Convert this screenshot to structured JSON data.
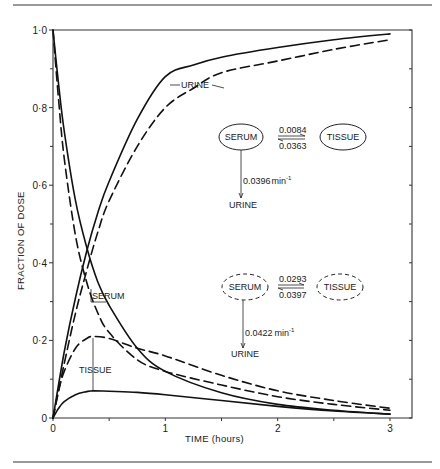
{
  "figure": {
    "top_rule": true,
    "bottom_rule": true
  },
  "chart_data": {
    "type": "line",
    "title": "",
    "xlabel": "TIME (hours)",
    "ylabel": "FRACTION OF DOSE",
    "xlim": [
      0,
      3
    ],
    "ylim": [
      0,
      1.0
    ],
    "x_ticks": [
      0,
      1,
      2,
      3
    ],
    "x_tick_labels": [
      "0",
      "1",
      "2",
      "3"
    ],
    "x_minor_ticks": [
      0.5,
      1.5,
      2.5
    ],
    "y_ticks": [
      0,
      0.2,
      0.4,
      0.6,
      0.8,
      1.0
    ],
    "y_tick_labels": [
      "0",
      "0·2",
      "0·4",
      "0·6",
      "0·8",
      "1·0"
    ],
    "y_minor_ticks": [
      0.1,
      0.3,
      0.5,
      0.7,
      0.9
    ],
    "right_axis_ticks": true,
    "grid": false,
    "legend": "none (inline labels and compartment diagrams)",
    "series": [
      {
        "name": "Urine (model 1, solid)",
        "style": "solid",
        "x": [
          0,
          0.1,
          0.2,
          0.3,
          0.4,
          0.5,
          0.75,
          1.0,
          1.25,
          1.5,
          2.0,
          2.5,
          3.0
        ],
        "y": [
          0,
          0.17,
          0.31,
          0.43,
          0.53,
          0.61,
          0.77,
          0.88,
          0.91,
          0.93,
          0.955,
          0.975,
          0.99
        ]
      },
      {
        "name": "Urine (model 2, dashed)",
        "style": "dashed",
        "x": [
          0,
          0.1,
          0.2,
          0.3,
          0.4,
          0.5,
          0.75,
          1.0,
          1.25,
          1.5,
          2.0,
          2.5,
          3.0
        ],
        "y": [
          0,
          0.14,
          0.27,
          0.38,
          0.48,
          0.56,
          0.7,
          0.8,
          0.85,
          0.89,
          0.92,
          0.95,
          0.975
        ]
      },
      {
        "name": "Serum (model 1, solid)",
        "style": "solid",
        "x": [
          0,
          0.05,
          0.1,
          0.2,
          0.3,
          0.4,
          0.5,
          0.75,
          1.0,
          1.5,
          2.0,
          2.5,
          3.0
        ],
        "y": [
          1.0,
          0.86,
          0.74,
          0.56,
          0.44,
          0.35,
          0.29,
          0.18,
          0.12,
          0.065,
          0.035,
          0.02,
          0.01
        ]
      },
      {
        "name": "Serum (model 2, dashed)",
        "style": "dashed",
        "x": [
          0,
          0.05,
          0.1,
          0.2,
          0.3,
          0.4,
          0.5,
          0.75,
          1.0,
          1.5,
          2.0,
          2.5,
          3.0
        ],
        "y": [
          1.0,
          0.82,
          0.67,
          0.47,
          0.35,
          0.27,
          0.22,
          0.15,
          0.12,
          0.085,
          0.055,
          0.035,
          0.02
        ]
      },
      {
        "name": "Tissue (model 1, solid)",
        "style": "solid",
        "x": [
          0,
          0.05,
          0.1,
          0.2,
          0.3,
          0.36,
          0.5,
          0.75,
          1.0,
          1.5,
          2.0,
          2.5,
          3.0
        ],
        "y": [
          0,
          0.025,
          0.042,
          0.06,
          0.068,
          0.07,
          0.069,
          0.066,
          0.06,
          0.045,
          0.03,
          0.018,
          0.01
        ]
      },
      {
        "name": "Tissue (model 2, dashed)",
        "style": "dashed",
        "x": [
          0,
          0.05,
          0.1,
          0.2,
          0.3,
          0.36,
          0.5,
          0.75,
          1.0,
          1.5,
          2.0,
          2.5,
          3.0
        ],
        "y": [
          0,
          0.07,
          0.12,
          0.18,
          0.205,
          0.21,
          0.205,
          0.18,
          0.16,
          0.11,
          0.07,
          0.045,
          0.025
        ]
      }
    ],
    "annotations": [
      {
        "text": "URINE",
        "target": "urine curves",
        "x": 0.95,
        "y": 0.89
      },
      {
        "text": "SERUM",
        "target": "serum curves",
        "x": 0.32,
        "y": 0.31
      },
      {
        "text": "TISSUE",
        "target": "tissue curves",
        "x": 0.28,
        "y": 0.12
      }
    ],
    "diagrams": [
      {
        "style": "solid",
        "serum_label": "SERUM",
        "tissue_label": "TISSUE",
        "urine_label": "URINE",
        "k_serum_to_tissue": "0.0084",
        "k_tissue_to_serum": "0.0363",
        "k_elimination": "0.0396",
        "unit": "min",
        "unit_exp": "-1"
      },
      {
        "style": "dashed",
        "serum_label": "SERUM",
        "tissue_label": "TISSUE",
        "urine_label": "URINE",
        "k_serum_to_tissue": "0.0293",
        "k_tissue_to_serum": "0.0397",
        "k_elimination": "0.0422",
        "unit": "min",
        "unit_exp": "-1"
      }
    ]
  }
}
